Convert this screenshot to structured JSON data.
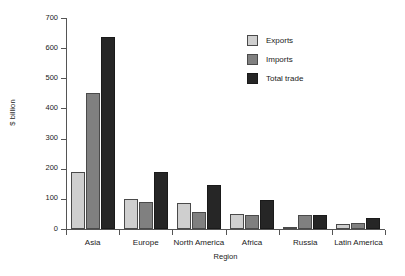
{
  "chart_data": {
    "type": "bar",
    "title": "",
    "xlabel": "Region",
    "ylabel": "$ billion",
    "ylim": [
      0,
      700
    ],
    "yticks": [
      0,
      100,
      200,
      300,
      400,
      500,
      600,
      700
    ],
    "ytick_labels": [
      "0",
      "100",
      "200",
      "300",
      "400",
      "500",
      "600",
      "700"
    ],
    "grid": false,
    "legend_position": "upper right",
    "categories": [
      "Asia",
      "Europe",
      "North America",
      "Africa",
      "Russia",
      "Latin America"
    ],
    "series": [
      {
        "name": "Exports",
        "color": "#cfcfcf",
        "values": [
          190,
          98,
          87,
          50,
          3,
          15
        ]
      },
      {
        "name": "Imports",
        "color": "#808080",
        "values": [
          450,
          90,
          58,
          45,
          45,
          20
        ]
      },
      {
        "name": "Total trade",
        "color": "#262626",
        "values": [
          638,
          188,
          145,
          95,
          48,
          36
        ]
      }
    ]
  },
  "legend": {
    "items": [
      {
        "label": "Exports",
        "swatch": "exports"
      },
      {
        "label": "Imports",
        "swatch": "imports"
      },
      {
        "label": "Total trade",
        "swatch": "total"
      }
    ]
  }
}
